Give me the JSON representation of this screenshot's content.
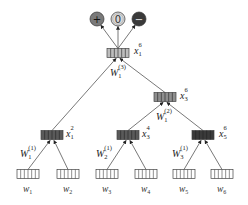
{
  "diagram": {
    "type": "recursive-neural-tensor-tree",
    "colors": {
      "edge": "#555555",
      "output_positive": "#7a7a7a",
      "output_neutral": "#d8d8d8",
      "output_negative": "#3a3a3a",
      "node_root": "#bdbdbd",
      "node_mid": "#8e8e8e",
      "node_dark": "#5a5a5a",
      "node_darkest": "#3a3a3a",
      "leaf": "#ffffff"
    },
    "outputs": [
      {
        "id": "pos",
        "symbol": "+",
        "x": 97,
        "y": 19
      },
      {
        "id": "neu",
        "symbol": "0",
        "x": 118,
        "y": 19
      },
      {
        "id": "neg",
        "symbol": "−",
        "x": 139,
        "y": 19
      }
    ],
    "nodes": [
      {
        "id": "x1_6",
        "label_base": "x",
        "label_sup": "6",
        "label_sub": "1",
        "x": 118,
        "y": 53,
        "shade": "node_root",
        "weight_base": "W",
        "weight_sup": "(3)",
        "weight_sub": "1"
      },
      {
        "id": "x3_6",
        "label_base": "x",
        "label_sup": "6",
        "label_sub": "3",
        "x": 165,
        "y": 97,
        "shade": "node_mid",
        "weight_base": "W",
        "weight_sup": "(2)",
        "weight_sub": "1"
      },
      {
        "id": "x1_2",
        "label_base": "x",
        "label_sup": "2",
        "label_sub": "1",
        "x": 52,
        "y": 135,
        "shade": "node_dark",
        "weight_base": "W",
        "weight_sup": "(1)",
        "weight_sub": "1"
      },
      {
        "id": "x3_4",
        "label_base": "x",
        "label_sup": "4",
        "label_sub": "3",
        "x": 128,
        "y": 135,
        "shade": "node_dark",
        "weight_base": "W",
        "weight_sup": "(1)",
        "weight_sub": "2"
      },
      {
        "id": "x5_6",
        "label_base": "x",
        "label_sup": "6",
        "label_sub": "5",
        "x": 203,
        "y": 135,
        "shade": "node_darkest",
        "weight_base": "W",
        "weight_sup": "(1)",
        "weight_sub": "3"
      }
    ],
    "leaves": [
      {
        "id": "w1",
        "label_base": "w",
        "label_sub": "1",
        "x": 28,
        "y": 174
      },
      {
        "id": "w2",
        "label_base": "w",
        "label_sub": "2",
        "x": 68,
        "y": 174
      },
      {
        "id": "w3",
        "label_base": "w",
        "label_sub": "3",
        "x": 107,
        "y": 174
      },
      {
        "id": "w4",
        "label_base": "w",
        "label_sub": "4",
        "x": 146,
        "y": 174
      },
      {
        "id": "w5",
        "label_base": "w",
        "label_sub": "5",
        "x": 184,
        "y": 174
      },
      {
        "id": "w6",
        "label_base": "w",
        "label_sub": "6",
        "x": 222,
        "y": 174
      }
    ]
  }
}
